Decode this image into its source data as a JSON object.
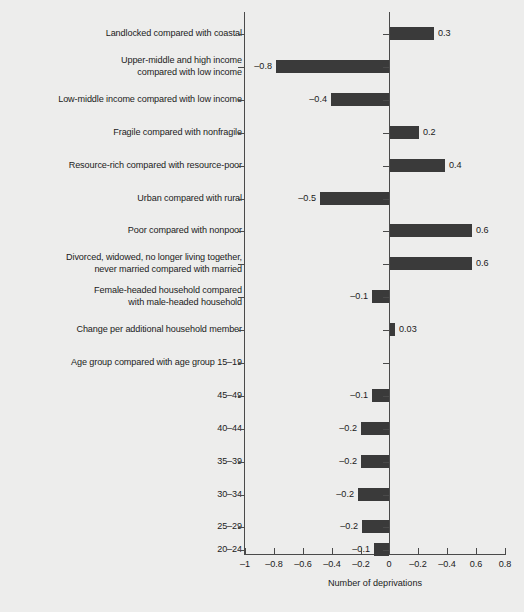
{
  "chart_data": {
    "type": "bar",
    "orientation": "horizontal",
    "title": "",
    "xlabel": "Number of deprivations",
    "ylabel": "",
    "xlim": [
      -1,
      0.8
    ],
    "grid": false,
    "legend": null,
    "bar_color": "#3a3a3a",
    "background_color": "#ededec",
    "axis_color": "#4a4a4a",
    "xticks": [
      -1,
      -0.8,
      -0.6,
      -0.4,
      -0.2,
      0,
      0.2,
      0.4,
      0.6,
      0.8
    ],
    "xtick_labels": [
      "–1",
      "–0.8",
      "–0.6",
      "–0.4",
      "–0.2",
      "0",
      "–0.2",
      "–0.4",
      "0.6",
      "0.8"
    ],
    "categories": [
      "Landlocked compared with coastal",
      "Upper-middle and high income\ncompared with low income",
      "Low-middle income compared with low income",
      "Fragile compared with nonfragile",
      "Resource-rich compared with resource-poor",
      "Urban compared with rural",
      "Poor compared with nonpoor",
      "Divorced, widowed, no longer living together,\nnever married compared with married",
      "Female-headed household compared\nwith male-headed household",
      "Change per additional household member",
      "Age group compared with age group 15–19",
      "45–49",
      "40–44",
      "35–39",
      "30–34",
      "25–29",
      "20–24"
    ],
    "values": [
      0.3,
      -0.8,
      -0.4,
      0.2,
      0.4,
      -0.5,
      0.6,
      0.6,
      -0.1,
      0.03,
      null,
      -0.1,
      -0.2,
      -0.2,
      -0.2,
      -0.2,
      -0.1
    ],
    "value_labels": [
      "0.3",
      "–0.8",
      "–0.4",
      "0.2",
      "0.4",
      "–0.5",
      "0.6",
      "0.6",
      "–0.1",
      "0.03",
      "",
      "–0.1",
      "–0.2",
      "–0.2",
      "–0.2",
      "–0.2",
      "–0.1"
    ],
    "bars": [
      {
        "label": "Landlocked compared with coastal",
        "value": 0.3,
        "value_label": "0.3",
        "row_y": 27,
        "bar_px": 44
      },
      {
        "label": "Upper-middle and high income\ncompared with low income",
        "value": -0.8,
        "value_label": "–0.8",
        "row_y": 60,
        "bar_px": 113
      },
      {
        "label": "Low-middle income compared with low income",
        "value": -0.4,
        "value_label": "–0.4",
        "row_y": 93,
        "bar_px": 58
      },
      {
        "label": "Fragile compared with nonfragile",
        "value": 0.2,
        "value_label": "0.2",
        "row_y": 126,
        "bar_px": 29
      },
      {
        "label": "Resource-rich compared with resource-poor",
        "value": 0.4,
        "value_label": "0.4",
        "row_y": 159,
        "bar_px": 55
      },
      {
        "label": "Urban compared with rural",
        "value": -0.5,
        "value_label": "–0.5",
        "row_y": 192,
        "bar_px": 69
      },
      {
        "label": "Poor compared with nonpoor",
        "value": 0.6,
        "value_label": "0.6",
        "row_y": 224,
        "bar_px": 82
      },
      {
        "label": "Divorced, widowed, no longer living together,\nnever married compared with married",
        "value": 0.6,
        "value_label": "0.6",
        "row_y": 257,
        "bar_px": 82
      },
      {
        "label": "Female-headed household compared\nwith male-headed household",
        "value": -0.1,
        "value_label": "–0.1",
        "row_y": 290,
        "bar_px": 17
      },
      {
        "label": "Change per additional household member",
        "value": 0.03,
        "value_label": "0.03",
        "row_y": 323,
        "bar_px": 5
      },
      {
        "label": "Age group compared with age group 15–19",
        "value": null,
        "value_label": "",
        "row_y": 356,
        "bar_px": 0
      },
      {
        "label": "45–49",
        "value": -0.1,
        "value_label": "–0.1",
        "row_y": 389,
        "bar_px": 17
      },
      {
        "label": "40–44",
        "value": -0.2,
        "value_label": "–0.2",
        "row_y": 422,
        "bar_px": 28
      },
      {
        "label": "35–39",
        "value": -0.2,
        "value_label": "–0.2",
        "row_y": 455,
        "bar_px": 28
      },
      {
        "label": "30–34",
        "value": -0.2,
        "value_label": "–0.2",
        "row_y": 488,
        "bar_px": 31
      },
      {
        "label": "25–29",
        "value": -0.2,
        "value_label": "–0.2",
        "row_y": 520,
        "bar_px": 27
      },
      {
        "label": "20–24",
        "value": -0.1,
        "value_label": "–0.1",
        "row_y": 543,
        "bar_px": 15
      }
    ]
  }
}
